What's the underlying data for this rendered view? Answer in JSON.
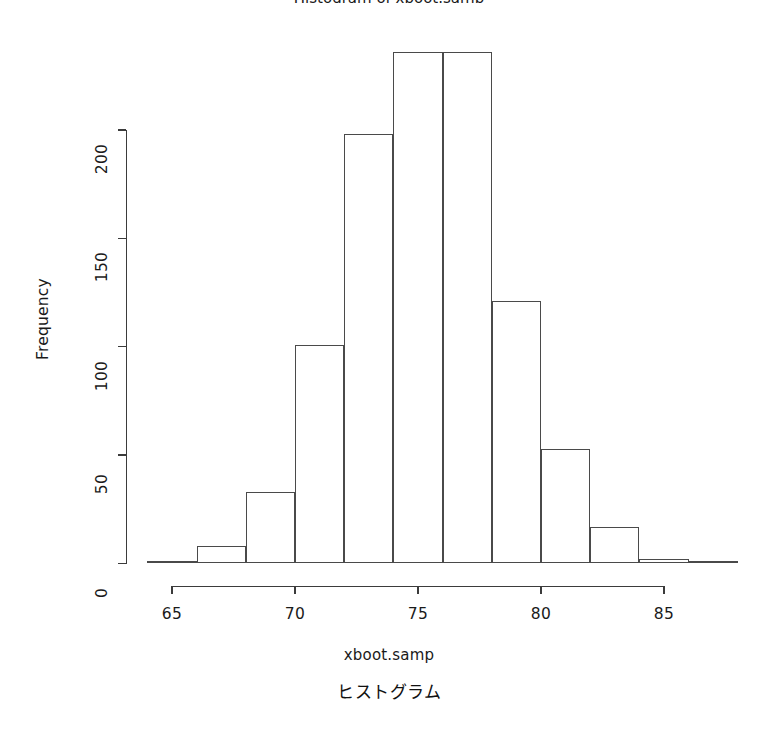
{
  "chart_data": {
    "type": "bar",
    "title": "Histogram of xboot.samp",
    "xlabel": "xboot.samp",
    "ylabel": "Frequency",
    "caption": "ヒストグラム",
    "categories": [
      "64-66",
      "66-68",
      "68-70",
      "70-72",
      "72-74",
      "74-76",
      "76-78",
      "78-80",
      "80-82",
      "82-84",
      "84-86",
      "86-88"
    ],
    "bin_edges": [
      64,
      66,
      68,
      70,
      72,
      74,
      76,
      78,
      80,
      82,
      84,
      86,
      88
    ],
    "values": [
      1,
      8,
      33,
      101,
      198,
      236,
      236,
      121,
      53,
      17,
      2,
      1
    ],
    "bin_width": 2,
    "xlim": [
      64,
      88
    ],
    "ylim": [
      0,
      236
    ],
    "xticks": [
      65,
      70,
      75,
      80,
      85
    ],
    "xtick_labels": [
      "65",
      "70",
      "75",
      "80",
      "85"
    ],
    "yticks": [
      0,
      50,
      100,
      150,
      200
    ],
    "ytick_labels": [
      "0",
      "50",
      "100",
      "150",
      "200"
    ],
    "grid": false,
    "legend": "none",
    "bar_fill": "#ffffff",
    "bar_stroke": "#4a4a4a",
    "axis_color": "#3b3b3b",
    "background": "#ffffff"
  },
  "axes": {
    "y_tick_labels": [
      "0",
      "50",
      "100",
      "150",
      "200"
    ],
    "x_tick_labels": [
      "65",
      "70",
      "75",
      "80",
      "85"
    ]
  },
  "labels": {
    "title": "Histogram of xboot.samp",
    "x_axis": "xboot.samp",
    "y_axis": "Frequency",
    "caption": "ヒストグラム"
  }
}
